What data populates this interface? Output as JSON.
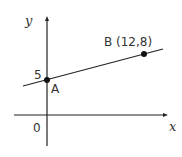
{
  "diagram": {
    "type": "coordinate-graph",
    "axes": {
      "x_label": "x",
      "y_label": "y",
      "origin_label": "0",
      "y_tick_label": "5"
    },
    "points": [
      {
        "id": "A",
        "label": "A"
      },
      {
        "id": "B",
        "label": "B (12,8)"
      }
    ],
    "line": {
      "through": [
        "A",
        "B"
      ]
    },
    "colors": {
      "stroke": "#222222",
      "text": "#333333"
    }
  }
}
